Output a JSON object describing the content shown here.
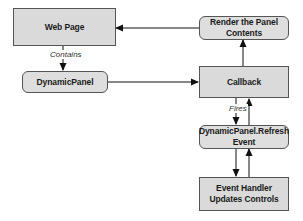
{
  "diagram": {
    "type": "flowchart",
    "nodes": [
      {
        "id": "web_page",
        "label": "Web Page",
        "shape": "rectangle"
      },
      {
        "id": "render",
        "label": "Render the Panel\nContents",
        "shape": "rounded"
      },
      {
        "id": "dynamic_panel",
        "label": "DynamicPanel",
        "shape": "rounded"
      },
      {
        "id": "callback",
        "label": "Callback",
        "shape": "rectangle"
      },
      {
        "id": "refresh_event",
        "label": "DynamicPanel.Refresh\nEvent",
        "shape": "rounded"
      },
      {
        "id": "event_handler",
        "label": "Event Handler\nUpdates Controls",
        "shape": "rectangle"
      }
    ],
    "edges": [
      {
        "from": "web_page",
        "to": "dynamic_panel",
        "label": "Contains"
      },
      {
        "from": "dynamic_panel",
        "to": "callback",
        "label": ""
      },
      {
        "from": "callback",
        "to": "render",
        "label": ""
      },
      {
        "from": "render",
        "to": "web_page",
        "label": ""
      },
      {
        "from": "callback",
        "to": "refresh_event",
        "label": "Fires"
      },
      {
        "from": "refresh_event",
        "to": "callback",
        "label": ""
      },
      {
        "from": "refresh_event",
        "to": "event_handler",
        "label": ""
      },
      {
        "from": "event_handler",
        "to": "refresh_event",
        "label": ""
      }
    ],
    "labels": {
      "web_page": "Web Page",
      "render": "Render the Panel\nContents",
      "dynamic_panel": "DynamicPanel",
      "callback": "Callback",
      "refresh_event": "DynamicPanel.Refresh\nEvent",
      "event_handler": "Event Handler\nUpdates Controls",
      "contains": "Contains",
      "fires": "Fires"
    },
    "colors": {
      "node_fill": "#dadada",
      "node_border": "#555555",
      "edge": "#111111",
      "background": "#ffffff"
    }
  }
}
